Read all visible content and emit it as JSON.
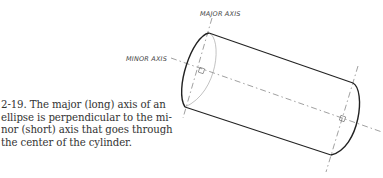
{
  "figure": {
    "number": "2-19.",
    "caption": "The major (long) axis of an ellipse is perpendicular to the minor (short) axis that goes through the center of the cylinder.",
    "caption_lines": [
      "2-19.  The major (long) axis of an",
      "ellipse is perpendicular to the mi-",
      "nor (short) axis that goes through",
      "the center of the cylinder."
    ],
    "labels": {
      "major_axis": "MAJOR AXIS",
      "minor_axis": "MINOR AXIS"
    }
  }
}
